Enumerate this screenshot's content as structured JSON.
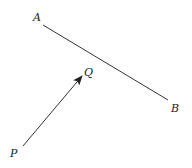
{
  "diagram": {
    "stroke_color": "#333333",
    "points": {
      "A": {
        "label": "A",
        "x": 43,
        "y": 25,
        "label_x": 33,
        "label_y": 21
      },
      "B": {
        "label": "B",
        "x": 168,
        "y": 100,
        "label_x": 171,
        "label_y": 112
      },
      "P": {
        "label": "P",
        "x": 23,
        "y": 146,
        "label_x": 10,
        "label_y": 157
      },
      "Q": {
        "label": "Q",
        "x": 82,
        "y": 76,
        "label_x": 84,
        "label_y": 76
      }
    },
    "segments": [
      {
        "from": "A",
        "to": "B",
        "type": "line"
      },
      {
        "from": "P",
        "to": "Q",
        "type": "arrow"
      }
    ]
  }
}
